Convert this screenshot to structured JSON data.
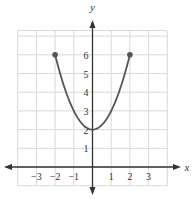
{
  "chart_data": {
    "type": "line",
    "title": "",
    "xlabel": "x",
    "ylabel": "y",
    "xlim": [
      -4,
      4
    ],
    "ylim": [
      -1,
      7
    ],
    "grid": true,
    "x_ticks": [
      "-3",
      "-2",
      "-1",
      "1",
      "2",
      "3"
    ],
    "y_ticks": [
      "1",
      "2",
      "3",
      "4",
      "5",
      "6"
    ],
    "series": [
      {
        "name": "y = x^2 + 2",
        "function": "x^2 + 2",
        "domain": [
          -2,
          2
        ],
        "x": [
          -2,
          -1.5,
          -1,
          -0.5,
          0,
          0.5,
          1,
          1.5,
          2
        ],
        "y": [
          6,
          4.25,
          3,
          2.25,
          2,
          2.25,
          3,
          4.25,
          6
        ],
        "endpoints": [
          [
            -2,
            6
          ],
          [
            2,
            6
          ]
        ],
        "endpoint_style": "closed"
      }
    ],
    "colors": {
      "curve": "#555555",
      "grid": "#d9d9d9",
      "axis": "#333333"
    }
  }
}
